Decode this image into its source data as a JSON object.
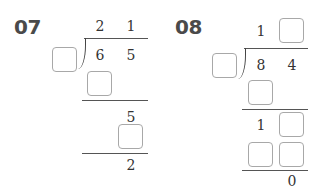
{
  "problems": [
    {
      "label": "07",
      "quotient": [
        "2",
        "1"
      ],
      "divisor": "",
      "dividend": [
        "6",
        "5"
      ],
      "step1_product": [
        ""
      ],
      "step1_remainder": [
        "5"
      ],
      "step2_product": [
        ""
      ],
      "final_remainder": "2"
    },
    {
      "label": "08",
      "quotient": [
        "1",
        ""
      ],
      "divisor": "",
      "dividend": [
        "8",
        "4"
      ],
      "step1_product": [
        ""
      ],
      "step1_remainder": [
        "1",
        ""
      ],
      "step2_product": [
        "",
        ""
      ],
      "final_remainder": "0"
    }
  ]
}
